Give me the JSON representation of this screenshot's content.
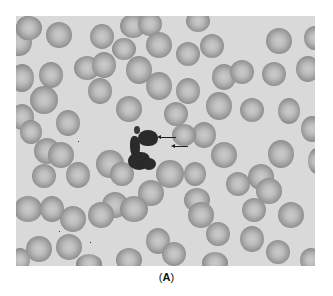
{
  "figure": {
    "background_color": "#d9d9d9",
    "cell_rim_color": "#858585",
    "cell_center_color": "#cbcbcb",
    "nucleus_color": "#2a2a2a",
    "arrow_count": 2,
    "caption_open": "(",
    "caption_letter": "A",
    "caption_close": ")"
  }
}
